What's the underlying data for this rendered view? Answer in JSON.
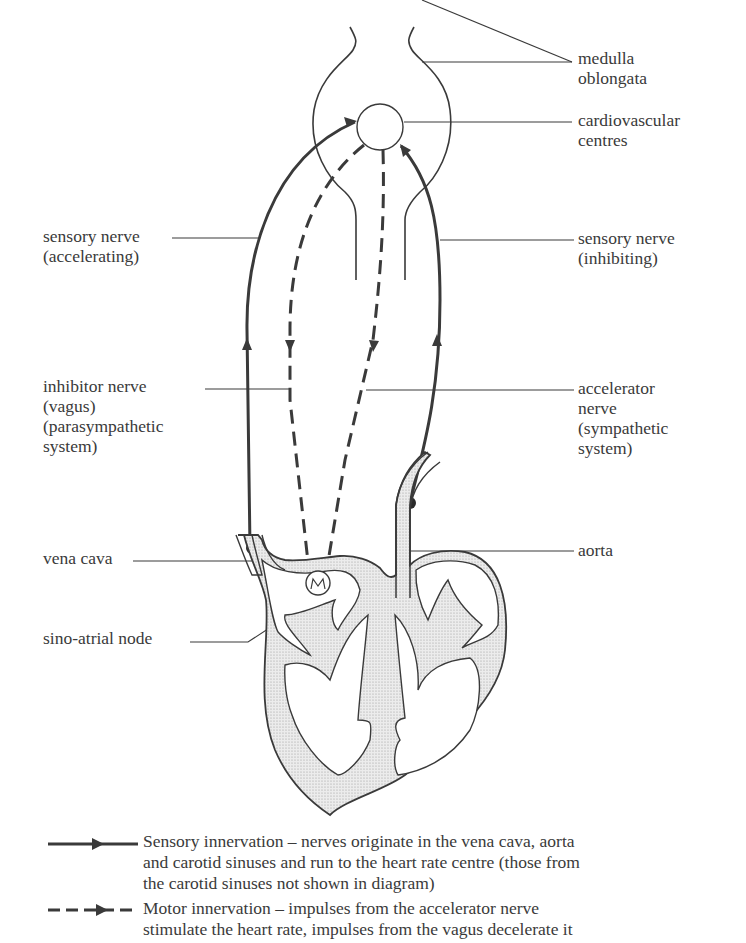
{
  "labels": {
    "medulla": [
      "medulla",
      "oblongata"
    ],
    "cardiovascular_centres": [
      "cardiovascular",
      "centres"
    ],
    "sensory_accelerating": [
      "sensory nerve",
      "(accelerating)"
    ],
    "sensory_inhibiting": [
      "sensory nerve",
      "(inhibiting)"
    ],
    "inhibitor_nerve": [
      "inhibitor nerve",
      "(vagus)",
      "(parasympathetic",
      "system)"
    ],
    "accelerator_nerve": [
      "accelerator",
      "nerve",
      "(sympathetic",
      "system)"
    ],
    "vena_cava": [
      "vena cava"
    ],
    "aorta": [
      "aorta"
    ],
    "sino_atrial_node": [
      "sino-atrial node"
    ]
  },
  "legend": {
    "sensory": {
      "line_style": "solid-arrow",
      "lines": [
        "Sensory innervation – nerves originate in the vena cava, aorta",
        "and carotid sinuses and run to the heart rate centre (those from",
        "the carotid sinuses not shown in diagram)"
      ]
    },
    "motor": {
      "line_style": "dashed-arrow",
      "lines": [
        "Motor innervation – impulses from the accelerator nerve",
        "stimulate the heart rate, impulses from the vagus decelerate it"
      ]
    }
  },
  "colors": {
    "ink": "#3a3a3a",
    "tissue_fill": "#e2e2e2",
    "background": "#ffffff"
  }
}
